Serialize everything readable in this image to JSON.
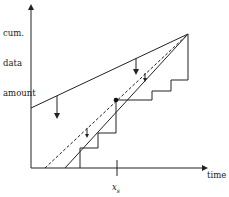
{
  "diagram": {
    "y_axis_label_lines": [
      "cum.",
      "data",
      "amount"
    ],
    "x_axis_label": "time",
    "marker_label_base": "x",
    "marker_label_sub": "s",
    "colors": {
      "line": "#222222",
      "background": "#ffffff"
    },
    "elements": [
      "upper-bound-line",
      "dashed-estimate-line",
      "solid-steep-line",
      "staircase-cumulative-data",
      "intersection-dot",
      "downward-arrows"
    ]
  }
}
